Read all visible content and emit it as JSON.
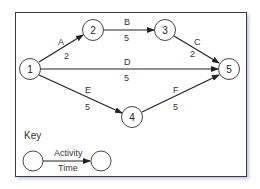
{
  "diagram": {
    "nodes": [
      {
        "id": "1",
        "label": "1"
      },
      {
        "id": "2",
        "label": "2"
      },
      {
        "id": "3",
        "label": "3"
      },
      {
        "id": "4",
        "label": "4"
      },
      {
        "id": "5",
        "label": "5"
      }
    ],
    "edges": [
      {
        "from": "1",
        "to": "2",
        "activity": "A",
        "time": "2"
      },
      {
        "from": "2",
        "to": "3",
        "activity": "B",
        "time": "5"
      },
      {
        "from": "3",
        "to": "5",
        "activity": "C",
        "time": "2"
      },
      {
        "from": "1",
        "to": "5",
        "activity": "D",
        "time": "5"
      },
      {
        "from": "1",
        "to": "4",
        "activity": "E",
        "time": "5"
      },
      {
        "from": "4",
        "to": "5",
        "activity": "F",
        "time": "5"
      }
    ],
    "key": {
      "title": "Key",
      "activity_label": "Activity",
      "time_label": "Time"
    }
  }
}
